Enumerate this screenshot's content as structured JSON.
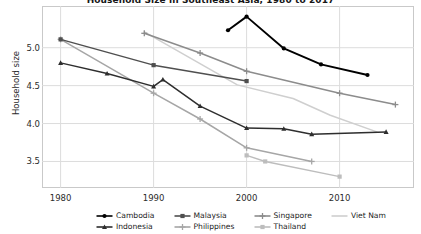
{
  "chart_data": {
    "type": "line",
    "title": "Household Size in Southeast Asia, 1980 to 2017",
    "xlabel": "",
    "ylabel": "Household size",
    "xlim": [
      1978,
      2018
    ],
    "ylim": [
      3.15,
      5.55
    ],
    "xticks": [
      1980,
      1990,
      2000,
      2010
    ],
    "yticks": [
      3.5,
      4.0,
      4.5,
      5.0
    ],
    "ytick_labels": [
      "3.5",
      "4.0",
      "4.5",
      "5.0"
    ],
    "xtick_labels": [
      "1980",
      "1990",
      "2000",
      "2010"
    ],
    "grid": true,
    "legend_position": "bottom",
    "series": [
      {
        "name": "Cambodia",
        "color": "#000000",
        "marker": "circle",
        "points": [
          [
            1998,
            5.23
          ],
          [
            2000,
            5.41
          ],
          [
            2004,
            4.99
          ],
          [
            2008,
            4.78
          ],
          [
            2013,
            4.64
          ]
        ]
      },
      {
        "name": "Indonesia",
        "color": "#2e2e2e",
        "marker": "triangle",
        "points": [
          [
            1980,
            4.8
          ],
          [
            1985,
            4.66
          ],
          [
            1990,
            4.49
          ],
          [
            1991,
            4.58
          ],
          [
            1995,
            4.23
          ],
          [
            2000,
            3.94
          ],
          [
            2004,
            3.93
          ],
          [
            2007,
            3.86
          ],
          [
            2015,
            3.89
          ]
        ]
      },
      {
        "name": "Malaysia",
        "color": "#4f4f4f",
        "marker": "square",
        "points": [
          [
            1980,
            5.11
          ],
          [
            1990,
            4.77
          ],
          [
            2000,
            4.56
          ]
        ]
      },
      {
        "name": "Philippines",
        "color": "#a6a6a6",
        "marker": "plus",
        "points": [
          [
            1980,
            5.11
          ],
          [
            1990,
            4.4
          ],
          [
            1995,
            4.06
          ],
          [
            2000,
            3.68
          ],
          [
            2007,
            3.5
          ]
        ]
      },
      {
        "name": "Singapore",
        "color": "#8c8c8c",
        "marker": "plus",
        "points": [
          [
            1989,
            5.19
          ],
          [
            1995,
            4.93
          ],
          [
            2000,
            4.69
          ],
          [
            2010,
            4.4
          ],
          [
            2016,
            4.25
          ]
        ]
      },
      {
        "name": "Thailand",
        "color": "#bdbdbd",
        "marker": "square",
        "points": [
          [
            2000,
            3.58
          ],
          [
            2002,
            3.5
          ],
          [
            2010,
            3.3
          ]
        ]
      },
      {
        "name": "Viet Nam",
        "color": "#cfcfcf",
        "marker": "none",
        "points": [
          [
            1989,
            5.21
          ],
          [
            1999,
            4.51
          ],
          [
            2004,
            4.36
          ],
          [
            2005,
            4.33
          ],
          [
            2009,
            4.11
          ],
          [
            2014,
            3.89
          ]
        ]
      }
    ]
  },
  "legend": {
    "items": [
      {
        "label": "Cambodia",
        "color": "#000000",
        "marker": "circle"
      },
      {
        "label": "Malaysia",
        "color": "#4f4f4f",
        "marker": "square"
      },
      {
        "label": "Singapore",
        "color": "#8c8c8c",
        "marker": "plus"
      },
      {
        "label": "Viet Nam",
        "color": "#cfcfcf",
        "marker": "none"
      },
      {
        "label": "Indonesia",
        "color": "#2e2e2e",
        "marker": "triangle"
      },
      {
        "label": "Philippines",
        "color": "#a6a6a6",
        "marker": "plus"
      },
      {
        "label": "Thailand",
        "color": "#bdbdbd",
        "marker": "square"
      }
    ]
  },
  "colors": {
    "grid": "#dcdcdc",
    "frame": "#c9c9c9",
    "text": "#2b2b2b",
    "background": "#ffffff"
  }
}
